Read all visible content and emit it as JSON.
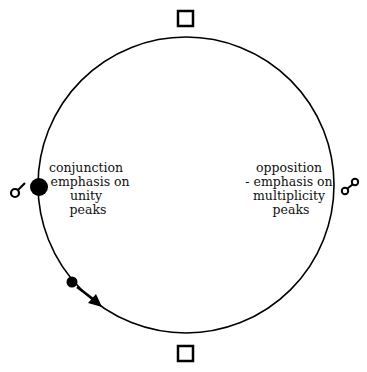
{
  "diagram": {
    "left_label": [
      "conjunction",
      "- emphasis on",
      "unity",
      "peaks"
    ],
    "right_label": [
      "opposition",
      "- emphasis on",
      "multiplicity",
      "peaks"
    ],
    "icons": {
      "top": "square-icon",
      "bottom": "square-icon",
      "left": "conjunction-symbol-icon",
      "right": "opposition-symbol-icon"
    },
    "colors": {
      "stroke": "#000000",
      "background": "#ffffff"
    }
  }
}
